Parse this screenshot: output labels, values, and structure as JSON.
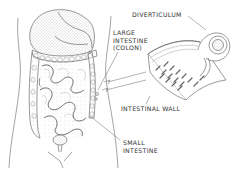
{
  "diagram": {
    "labels": {
      "diverticulum": "DIVERTICULUM",
      "large_intestine_line1": "LARGE",
      "large_intestine_line2": "INTESTINE",
      "large_intestine_line3": "(COLON)",
      "intestinal_wall": "INTESTINAL WALL",
      "small_intestine_line1": "SMALL",
      "small_intestine_line2": "INTESTINE"
    },
    "colors": {
      "line": "#555555",
      "stipple": "#9a9a9a",
      "background": "#ffffff"
    }
  }
}
